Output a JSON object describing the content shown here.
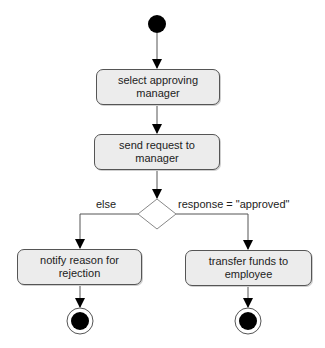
{
  "diagram": {
    "type": "UML activity diagram",
    "start": {
      "kind": "initial-node"
    },
    "activities": [
      {
        "id": "a1",
        "label": "select approving manager"
      },
      {
        "id": "a2",
        "label": "send request to manager"
      },
      {
        "id": "a3",
        "label": "notify reason for rejection"
      },
      {
        "id": "a4",
        "label": "transfer funds to employee"
      }
    ],
    "decision": {
      "kind": "decision-node",
      "branches": [
        {
          "guard": "else",
          "target": "a3"
        },
        {
          "guard": "response = \"approved\"",
          "target": "a4"
        }
      ]
    },
    "ends": [
      {
        "kind": "final-node",
        "after": "a3"
      },
      {
        "kind": "final-node",
        "after": "a4"
      }
    ],
    "edges": [
      [
        "start",
        "a1"
      ],
      [
        "a1",
        "a2"
      ],
      [
        "a2",
        "decision"
      ],
      [
        "decision",
        "a3"
      ],
      [
        "decision",
        "a4"
      ],
      [
        "a3",
        "end1"
      ],
      [
        "a4",
        "end2"
      ]
    ]
  },
  "labels": {
    "a1_line1": "select approving",
    "a1_line2": "manager",
    "a2_line1": "send request to",
    "a2_line2": "manager",
    "a3_line1": "notify reason for",
    "a3_line2": "rejection",
    "a4_line1": "transfer funds to",
    "a4_line2": "employee",
    "guard_else": "else",
    "guard_approved": "response = \"approved\""
  },
  "colors": {
    "node_fill": "#ececec",
    "stroke": "#555555",
    "text": "#222222",
    "dot": "#000000"
  }
}
